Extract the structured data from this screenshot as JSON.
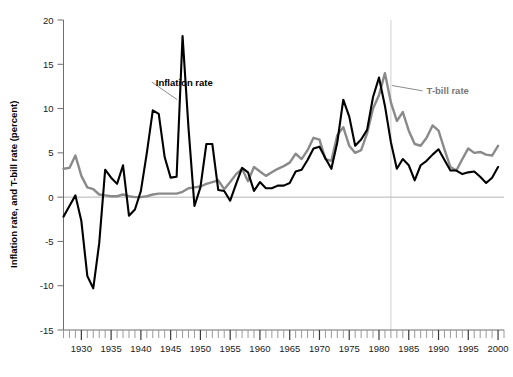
{
  "chart_data": {
    "type": "line",
    "title": "",
    "xlabel": "",
    "ylabel": "Inflation rate, and T-bill rate (percent)",
    "xlim": [
      1927,
      2001
    ],
    "ylim": [
      -15,
      20
    ],
    "yticks": [
      20,
      15,
      10,
      5,
      0,
      -5,
      -10,
      -15
    ],
    "ytick_labels": [
      "20",
      "15",
      "10",
      "5",
      "0",
      "-5",
      "-10",
      "-15"
    ],
    "xticks": [
      1930,
      1935,
      1940,
      1945,
      1950,
      1955,
      1960,
      1965,
      1970,
      1975,
      1980,
      1985,
      1990,
      1995,
      2000
    ],
    "xtick_labels": [
      "1930",
      "1935",
      "1940",
      "1945",
      "1950",
      "1955",
      "1960",
      "1965",
      "1970",
      "1975",
      "1980",
      "1985",
      "1990",
      "1995",
      "2000"
    ],
    "minor_tick_interval": 1,
    "grid": "vertical-single",
    "vertical_gridline_x": 1982,
    "zero_reference_line": 0,
    "legend_position": "inline-annotations",
    "x": [
      1927,
      1928,
      1929,
      1930,
      1931,
      1932,
      1933,
      1934,
      1935,
      1936,
      1937,
      1938,
      1939,
      1940,
      1941,
      1942,
      1943,
      1944,
      1945,
      1946,
      1947,
      1948,
      1949,
      1950,
      1951,
      1952,
      1953,
      1954,
      1955,
      1956,
      1957,
      1958,
      1959,
      1960,
      1961,
      1962,
      1963,
      1964,
      1965,
      1966,
      1967,
      1968,
      1969,
      1970,
      1971,
      1972,
      1973,
      1974,
      1975,
      1976,
      1977,
      1978,
      1979,
      1980,
      1981,
      1982,
      1983,
      1984,
      1985,
      1986,
      1987,
      1988,
      1989,
      1990,
      1991,
      1992,
      1993,
      1994,
      1995,
      1996,
      1997,
      1998,
      1999,
      2000
    ],
    "series": [
      {
        "name": "Inflation rate",
        "color": "#000000",
        "label_position": {
          "x": 1942.5,
          "y": 13.0
        },
        "values": [
          -2.2,
          -1.0,
          0.2,
          -2.7,
          -8.9,
          -10.3,
          -5.2,
          3.1,
          2.2,
          1.5,
          3.6,
          -2.1,
          -1.4,
          0.7,
          5.0,
          9.8,
          9.4,
          4.5,
          2.2,
          2.3,
          18.2,
          7.8,
          -1.0,
          1.1,
          6.0,
          6.0,
          0.8,
          0.7,
          -0.4,
          1.5,
          3.3,
          2.8,
          0.7,
          1.7,
          1.0,
          1.0,
          1.3,
          1.3,
          1.6,
          2.9,
          3.1,
          4.2,
          5.5,
          5.7,
          4.4,
          3.2,
          6.2,
          11.0,
          9.1,
          5.8,
          6.5,
          7.6,
          11.3,
          13.5,
          10.3,
          6.2,
          3.2,
          4.3,
          3.6,
          1.9,
          3.6,
          4.1,
          4.8,
          5.4,
          4.2,
          3.0,
          3.0,
          2.6,
          2.8,
          2.9,
          2.3,
          1.6,
          2.2,
          3.4
        ]
      },
      {
        "name": "T-bill rate",
        "color": "#8a8a8a",
        "label_position": {
          "x": 1988.0,
          "y": 12.0
        },
        "values": [
          3.2,
          3.3,
          4.7,
          2.4,
          1.1,
          0.9,
          0.3,
          0.2,
          0.1,
          0.1,
          0.3,
          0.1,
          0.0,
          0.0,
          0.1,
          0.3,
          0.4,
          0.4,
          0.4,
          0.4,
          0.6,
          1.0,
          1.1,
          1.2,
          1.5,
          1.7,
          1.9,
          0.9,
          1.7,
          2.6,
          3.2,
          1.8,
          3.4,
          2.9,
          2.4,
          2.8,
          3.2,
          3.5,
          3.9,
          4.9,
          4.3,
          5.3,
          6.7,
          6.5,
          4.3,
          4.1,
          7.0,
          7.9,
          5.8,
          5.0,
          5.3,
          7.2,
          10.0,
          11.5,
          14.0,
          10.7,
          8.6,
          9.6,
          7.5,
          6.0,
          5.8,
          6.7,
          8.1,
          7.5,
          5.4,
          3.4,
          3.0,
          4.3,
          5.5,
          5.0,
          5.1,
          4.8,
          4.7,
          5.8
        ]
      }
    ]
  },
  "annotations": {
    "inflation_label": "Inflation rate",
    "tbill_label": "T-bill rate"
  },
  "axis": {
    "y_title": "Inflation rate, and T-bill rate (percent)"
  }
}
